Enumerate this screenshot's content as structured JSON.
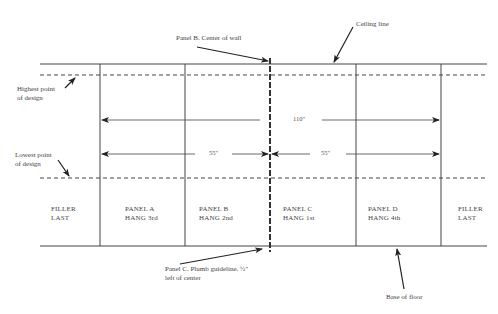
{
  "callouts": {
    "panel_b_center": "Panel B. Center of wall",
    "ceiling_line": "Ceiling line",
    "highest_point": [
      "Highest point",
      "of design"
    ],
    "lowest_point": [
      "Lowest point",
      "of design"
    ],
    "plumb_guideline": [
      "Panel C. Plumb guideline. ½\"",
      "left of center"
    ],
    "base_of_floor": "Base of floor"
  },
  "dimensions": {
    "total": "110\"",
    "left_half": "55\"",
    "right_half": "55\""
  },
  "panels": [
    {
      "name": "FILLER",
      "order": "LAST"
    },
    {
      "name": "PANEL A",
      "order": "HANG 3rd"
    },
    {
      "name": "PANEL B",
      "order": "HANG 2nd"
    },
    {
      "name": "PANEL C",
      "order": "HANG 1st"
    },
    {
      "name": "PANEL D",
      "order": "HANG 4th"
    },
    {
      "name": "FILLER",
      "order": "LAST"
    }
  ],
  "colors": {
    "line": "#333333",
    "text": "#444444"
  }
}
